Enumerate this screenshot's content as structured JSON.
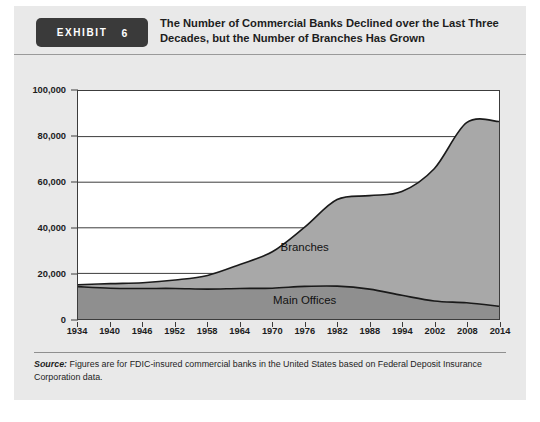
{
  "exhibit": {
    "badge_label": "EXHIBIT",
    "badge_number": "6",
    "title": "The Number of Commercial Banks Declined over the Last Three Decades, but the Number of Branches Has Grown",
    "source_prefix": "Source:",
    "source_text": " Figures are for FDIC-insured commercial banks in the United States based on Federal Deposit Insurance Corporation data."
  },
  "colors": {
    "badge_bg": "#3a3a3a",
    "panel_bg": "#e9e9e9",
    "plot_bg": "#ffffff",
    "branches_fill": "#a8a8a8",
    "main_offices_fill": "#8f8f8f",
    "line_stroke": "#1a1a1a",
    "axis": "#3c3c3c"
  },
  "chart_data": {
    "type": "area",
    "stacked": true,
    "title": "The Number of Commercial Banks Declined over the Last Three Decades, but the Number of Branches Has Grown",
    "xlabel": "",
    "ylabel": "",
    "grid": true,
    "legend_position": "inline-annotations",
    "x": [
      1934,
      1940,
      1946,
      1952,
      1958,
      1964,
      1970,
      1976,
      1982,
      1988,
      1994,
      2002,
      2008,
      2014
    ],
    "tick_labels": [
      "1934",
      "1940",
      "1946",
      "1952",
      "1958",
      "1964",
      "1970",
      "1976",
      "1982",
      "1988",
      "1994",
      "2002",
      "2008",
      "2014"
    ],
    "ylim": [
      0,
      100000
    ],
    "yticks": [
      0,
      20000,
      40000,
      60000,
      80000,
      100000
    ],
    "ytick_labels": [
      "0",
      "20,000",
      "40,000",
      "60,000",
      "80,000",
      "100,000"
    ],
    "series": [
      {
        "name": "Main Offices",
        "values": [
          14200,
          13500,
          13400,
          13400,
          13100,
          13400,
          13500,
          14300,
          14400,
          13100,
          10400,
          7900,
          7100,
          5600
        ]
      },
      {
        "name": "Branches",
        "values": [
          800,
          2000,
          2500,
          3700,
          6000,
          10500,
          16000,
          26000,
          38000,
          41000,
          45500,
          58000,
          79000,
          81000
        ]
      }
    ],
    "totals": [
      15000,
      15500,
      15900,
      17100,
      19100,
      23900,
      29500,
      40300,
      52400,
      54100,
      55900,
      65900,
      86100,
      86600
    ],
    "annotations": [
      {
        "text": "Branches",
        "x": 1976,
        "y": 30000
      },
      {
        "text": "Main Offices",
        "x": 1976,
        "y": 6500
      }
    ]
  }
}
